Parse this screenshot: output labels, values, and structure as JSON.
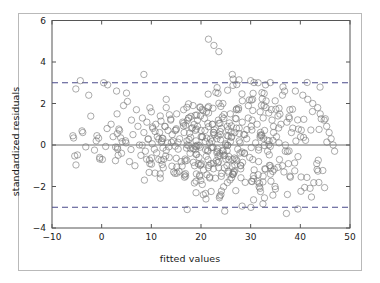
{
  "chart_data": {
    "type": "scatter",
    "title": "",
    "xlabel": "fitted values",
    "ylabel": "standardized residuals",
    "xlim": [
      -10,
      50
    ],
    "ylim": [
      -4,
      6
    ],
    "xticks": [
      -10,
      0,
      10,
      20,
      30,
      40,
      50
    ],
    "yticks": [
      -4,
      -2,
      0,
      2,
      4,
      6
    ],
    "xtick_labels": [
      "−10",
      "0",
      "10",
      "20",
      "30",
      "40",
      "50"
    ],
    "ytick_labels": [
      "−4",
      "−2",
      "0",
      "2",
      "4",
      "6"
    ],
    "grid": false,
    "legend": false,
    "marker": "open-circle",
    "marker_color": "#7a7a7a",
    "marker_size": 4.6,
    "reference_lines": [
      {
        "name": "zero-line",
        "y": 0,
        "style": "solid",
        "color": "#6e6e6e"
      },
      {
        "name": "upper-threshold",
        "y": 3,
        "style": "dashed",
        "color": "#4a4a8a"
      },
      {
        "name": "lower-threshold",
        "y": -3,
        "style": "dashed",
        "color": "#4a4a8a"
      }
    ],
    "n_points": 520,
    "points": [
      [
        -5.2,
        2.7
      ],
      [
        -4.3,
        3.1
      ],
      [
        -2.6,
        2.4
      ],
      [
        -1.1,
        0.2
      ],
      [
        -0.4,
        -0.6
      ],
      [
        0.4,
        3.0
      ],
      [
        1.2,
        2.9
      ],
      [
        1.9,
        1.0
      ],
      [
        2.3,
        0.4
      ],
      [
        2.8,
        -0.1
      ],
      [
        3.1,
        1.5
      ],
      [
        3.6,
        0.7
      ],
      [
        4.0,
        -0.4
      ],
      [
        4.4,
        1.9
      ],
      [
        4.9,
        0.1
      ],
      [
        5.2,
        2.1
      ],
      [
        5.6,
        -0.8
      ],
      [
        6.0,
        1.2
      ],
      [
        6.3,
        0.5
      ],
      [
        6.7,
        -1.0
      ],
      [
        7.0,
        1.7
      ],
      [
        7.3,
        0.9
      ],
      [
        7.6,
        0.0
      ],
      [
        7.9,
        -0.5
      ],
      [
        8.2,
        1.3
      ],
      [
        8.5,
        0.6
      ],
      [
        8.8,
        -0.3
      ],
      [
        9.1,
        1.1
      ],
      [
        9.4,
        0.3
      ],
      [
        9.7,
        -0.9
      ],
      [
        10.0,
        1.6
      ],
      [
        10.3,
        0.8
      ],
      [
        10.6,
        -0.2
      ],
      [
        10.9,
        1.0
      ],
      [
        11.2,
        0.4
      ],
      [
        11.5,
        -0.7
      ],
      [
        11.8,
        1.4
      ],
      [
        12.1,
        0.2
      ],
      [
        12.4,
        -1.1
      ],
      [
        12.7,
        0.9
      ],
      [
        13.0,
        1.8
      ],
      [
        13.3,
        0.1
      ],
      [
        13.6,
        -0.6
      ],
      [
        13.9,
        1.2
      ],
      [
        14.2,
        0.5
      ],
      [
        14.5,
        -1.3
      ],
      [
        14.8,
        0.7
      ],
      [
        15.1,
        1.5
      ],
      [
        15.4,
        -0.2
      ],
      [
        15.7,
        0.3
      ],
      [
        16.0,
        -0.8
      ],
      [
        16.3,
        1.1
      ],
      [
        16.6,
        0.6
      ],
      [
        16.9,
        -1.5
      ],
      [
        17.2,
        0.0
      ],
      [
        17.5,
        1.3
      ],
      [
        17.8,
        -0.4
      ],
      [
        18.1,
        0.8
      ],
      [
        18.4,
        1.9
      ],
      [
        18.7,
        -1.0
      ],
      [
        19.0,
        0.2
      ],
      [
        19.3,
        0.9
      ],
      [
        19.6,
        -0.6
      ],
      [
        19.9,
        1.4
      ],
      [
        20.2,
        0.4
      ],
      [
        20.5,
        -1.2
      ],
      [
        20.8,
        0.7
      ],
      [
        21.1,
        1.6
      ],
      [
        21.4,
        -0.3
      ],
      [
        21.7,
        0.1
      ],
      [
        22.0,
        -0.9
      ],
      [
        22.3,
        1.0
      ],
      [
        22.6,
        0.5
      ],
      [
        22.9,
        -1.6
      ],
      [
        23.2,
        0.3
      ],
      [
        23.5,
        1.2
      ],
      [
        23.8,
        -0.5
      ],
      [
        24.1,
        0.8
      ],
      [
        24.4,
        2.0
      ],
      [
        24.7,
        -1.1
      ],
      [
        25.0,
        0.0
      ],
      [
        25.3,
        0.9
      ],
      [
        25.6,
        -0.7
      ],
      [
        25.9,
        1.5
      ],
      [
        26.2,
        0.4
      ],
      [
        26.5,
        -1.4
      ],
      [
        26.8,
        0.6
      ],
      [
        27.1,
        1.7
      ],
      [
        27.4,
        -0.2
      ],
      [
        27.7,
        0.2
      ],
      [
        28.0,
        -1.0
      ],
      [
        28.3,
        1.1
      ],
      [
        28.6,
        0.5
      ],
      [
        28.9,
        -1.8
      ],
      [
        29.2,
        0.3
      ],
      [
        29.5,
        1.3
      ],
      [
        29.8,
        -0.6
      ],
      [
        30.1,
        0.9
      ],
      [
        30.4,
        2.2
      ],
      [
        30.7,
        -1.2
      ],
      [
        31.0,
        0.1
      ],
      [
        31.3,
        1.0
      ],
      [
        31.6,
        -0.8
      ],
      [
        31.9,
        1.6
      ],
      [
        32.2,
        0.5
      ],
      [
        32.5,
        -1.5
      ],
      [
        32.8,
        0.7
      ],
      [
        33.1,
        1.8
      ],
      [
        33.4,
        -0.3
      ],
      [
        33.7,
        0.2
      ],
      [
        34.0,
        -1.1
      ],
      [
        34.3,
        1.2
      ],
      [
        34.6,
        0.6
      ],
      [
        34.9,
        -2.0
      ],
      [
        35.2,
        0.4
      ],
      [
        35.5,
        1.4
      ],
      [
        35.8,
        -0.7
      ],
      [
        36.1,
        1.0
      ],
      [
        36.4,
        2.4
      ],
      [
        36.7,
        -1.3
      ],
      [
        37.0,
        0.0
      ],
      [
        37.3,
        1.1
      ],
      [
        37.6,
        -0.9
      ],
      [
        37.9,
        1.7
      ],
      [
        38.2,
        0.6
      ],
      [
        21.5,
        5.1
      ],
      [
        22.6,
        4.8
      ],
      [
        23.6,
        4.5
      ],
      [
        26.3,
        3.4
      ],
      [
        30.0,
        3.1
      ],
      [
        31.5,
        3.0
      ],
      [
        33.0,
        2.9
      ],
      [
        36.5,
        2.8
      ],
      [
        39.0,
        2.6
      ],
      [
        40.5,
        2.4
      ],
      [
        41.5,
        2.2
      ],
      [
        42.5,
        2.0
      ],
      [
        43.5,
        1.8
      ],
      [
        44.0,
        1.5
      ],
      [
        44.8,
        1.2
      ],
      [
        45.3,
        0.9
      ],
      [
        45.8,
        0.6
      ],
      [
        46.2,
        0.3
      ],
      [
        46.6,
        0.0
      ],
      [
        46.9,
        -0.3
      ],
      [
        8.5,
        3.4
      ],
      [
        13.0,
        2.2
      ],
      [
        16.5,
        1.7
      ],
      [
        19.0,
        -2.3
      ],
      [
        21.0,
        -2.6
      ],
      [
        24.0,
        -2.4
      ],
      [
        27.0,
        -2.2
      ],
      [
        37.2,
        -3.3
      ],
      [
        5.0,
        2.5
      ],
      [
        3.0,
        2.6
      ]
    ]
  },
  "figure": {
    "background": "#ffffff",
    "frame_color": "#b9b9b9",
    "axes_color": "#555555"
  }
}
